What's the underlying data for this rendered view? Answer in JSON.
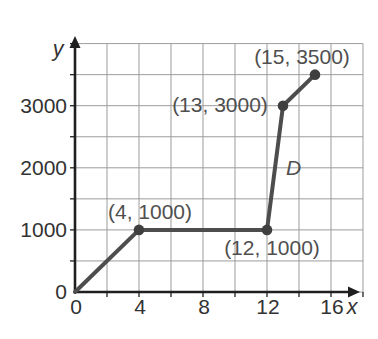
{
  "chart_data": {
    "type": "line",
    "title": "",
    "xlabel": "x",
    "ylabel": "y",
    "x_ticks": [
      0,
      4,
      8,
      12,
      16
    ],
    "y_ticks": [
      0,
      1000,
      2000,
      3000
    ],
    "xlim": [
      0,
      18
    ],
    "ylim": [
      0,
      4000
    ],
    "x_grid_step": 2,
    "y_grid_step": 500,
    "grid": true,
    "legend": "none",
    "series": [
      {
        "name": "D",
        "points": [
          [
            0,
            0
          ],
          [
            4,
            1000
          ],
          [
            12,
            1000
          ],
          [
            13,
            3000
          ],
          [
            15,
            3500
          ]
        ],
        "markers": [
          [
            4,
            1000
          ],
          [
            12,
            1000
          ],
          [
            13,
            3000
          ],
          [
            15,
            3500
          ]
        ]
      }
    ],
    "annotations": [
      {
        "text": "(4, 1000)",
        "x": 4,
        "y": 1000,
        "dx": 11,
        "dy": -18,
        "italic": false
      },
      {
        "text": "(12, 1000)",
        "x": 12,
        "y": 1000,
        "dx": 5,
        "dy": 18,
        "italic": false
      },
      {
        "text": "(13, 3000)",
        "x": 13,
        "y": 3000,
        "dx": -63,
        "dy": -1,
        "italic": false
      },
      {
        "text": "(15, 3500)",
        "x": 15,
        "y": 3500,
        "dx": -13,
        "dy": -18,
        "italic": false
      },
      {
        "text": "D",
        "x": 13.6,
        "y": 2000,
        "dx": 1,
        "dy": 0,
        "italic": true
      }
    ],
    "colors": {
      "line": "#4d4d4d",
      "marker": "#3f3f3f",
      "grid": "#9c9c9c",
      "axis": "#1f1f1f",
      "tick_text": "#323232",
      "annotation_text": "#4f4f4f"
    },
    "layout": {
      "origin_px": [
        75,
        292
      ],
      "px_per_x_unit": 16,
      "px_per_y_unit": 0.0621,
      "x_axis_arrow_tip_px": 360,
      "y_axis_arrow_tip_px": 36
    }
  }
}
